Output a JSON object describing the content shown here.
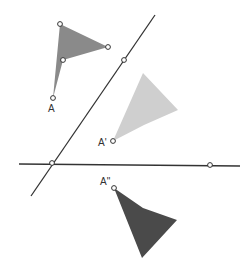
{
  "diagram": {
    "width": 251,
    "height": 272,
    "colors": {
      "line": "#333333",
      "point_fill": "#ffffff",
      "original_shape": "#8a8a8a",
      "first_reflection": "#cfcfcf",
      "second_reflection": "#4a4a4a"
    },
    "lines": [
      {
        "id": "mirror-diagonal",
        "x1": 155,
        "y1": 15,
        "x2": 31,
        "y2": 196
      },
      {
        "id": "mirror-horizontal",
        "x1": 19,
        "y1": 164,
        "x2": 240,
        "y2": 166
      }
    ],
    "line_points": [
      {
        "id": "diagonal-point",
        "x": 124,
        "y": 60
      },
      {
        "id": "intersection-point",
        "x": 52,
        "y": 163
      },
      {
        "id": "horizontal-point",
        "x": 210,
        "y": 165
      }
    ],
    "shapes": [
      {
        "id": "original",
        "points": "53,98 60,24 108,47 63,60",
        "vertices": [
          {
            "x": 60,
            "y": 24
          },
          {
            "x": 108,
            "y": 47
          },
          {
            "x": 63,
            "y": 60
          },
          {
            "x": 53,
            "y": 98
          }
        ]
      },
      {
        "id": "first-reflection",
        "points": "113,141 143,73 178,110 144,125",
        "vertices": [
          {
            "x": 113,
            "y": 141
          }
        ]
      },
      {
        "id": "second-reflection",
        "points": "114,188 143,208 177,220 142,258",
        "vertices": [
          {
            "x": 114,
            "y": 188
          }
        ]
      }
    ],
    "labels": {
      "A": {
        "text": "A",
        "x": 48,
        "y": 112
      },
      "A_prime": {
        "text": "A'",
        "x": 98,
        "y": 146
      },
      "A_double_prime": {
        "text": "A\"",
        "x": 100,
        "y": 185
      }
    }
  }
}
